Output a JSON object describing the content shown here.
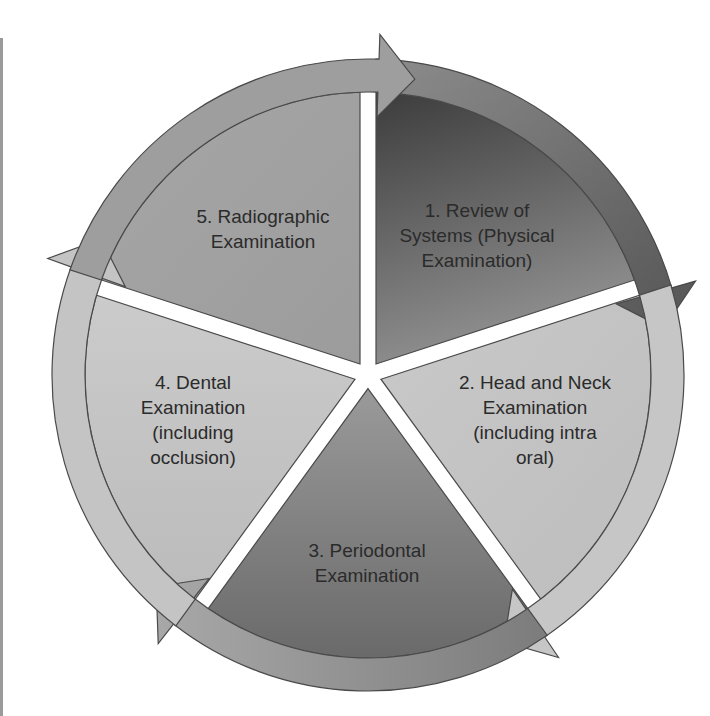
{
  "diagram": {
    "type": "cycle",
    "center": [
      368,
      375
    ],
    "outer_radius": 316,
    "inner_radius": 283,
    "stroke_color": "#4a4a4a",
    "steps": [
      {
        "id": 1,
        "lines": [
          "1. Review of",
          "Systems (Physical",
          "Examination)"
        ],
        "wedge_color_start": "#3e3e3e",
        "wedge_color_end": "#8e8e8e",
        "band_color": "#6a6a6a"
      },
      {
        "id": 2,
        "lines": [
          "2. Head and Neck",
          "Examination",
          "(including intra",
          "oral)"
        ],
        "wedge_color_start": "#bdbdbd",
        "wedge_color_end": "#cfcfcf",
        "band_color": "#c9c9c9"
      },
      {
        "id": 3,
        "lines": [
          "3. Periodontal",
          "Examination"
        ],
        "wedge_color_start": "#8e8e8e",
        "wedge_color_end": "#6e6e6e",
        "band_color": "#8a8a8a"
      },
      {
        "id": 4,
        "lines": [
          "4. Dental",
          "Examination",
          "(including",
          "occlusion)"
        ],
        "wedge_color_start": "#c7c7c7",
        "wedge_color_end": "#bcbcbc",
        "band_color": "#c4c4c4"
      },
      {
        "id": 5,
        "lines": [
          "5. Radiographic",
          "Examination"
        ],
        "wedge_color_start": "#a2a2a2",
        "wedge_color_end": "#a2a2a2",
        "band_color": "#9c9c9c"
      }
    ]
  }
}
